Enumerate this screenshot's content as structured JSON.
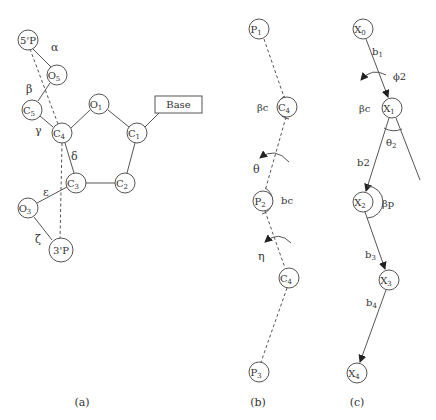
{
  "panels": {
    "a": {
      "caption": "(a)",
      "nodes": {
        "p5": "5'P",
        "o5": {
          "base": "O",
          "sub": "5"
        },
        "c5": {
          "base": "C",
          "sub": "5"
        },
        "c4": {
          "base": "C",
          "sub": "4"
        },
        "o1": {
          "base": "O",
          "sub": "1"
        },
        "c1": {
          "base": "C",
          "sub": "1"
        },
        "c2": {
          "base": "C",
          "sub": "2"
        },
        "c3": {
          "base": "C",
          "sub": "3"
        },
        "o3": {
          "base": "O",
          "sub": "3"
        },
        "p3": "3'P"
      },
      "base_box": "Base",
      "torsions": {
        "alpha": "α",
        "beta": "β",
        "gamma": "γ",
        "delta": "δ",
        "epsilon": "ε",
        "zeta": "ζ"
      }
    },
    "b": {
      "caption": "(b)",
      "nodes": [
        {
          "base": "P",
          "sub": "1"
        },
        {
          "base": "C",
          "sub": "4"
        },
        {
          "base": "P",
          "sub": "2"
        },
        {
          "base": "C",
          "sub": "4"
        },
        {
          "base": "P",
          "sub": "3"
        }
      ],
      "labels": {
        "beta_c": "βc",
        "theta": "θ",
        "bc": "bc",
        "eta": "η"
      }
    },
    "c": {
      "caption": "(c)",
      "nodes": [
        {
          "base": "X",
          "sub": "0"
        },
        {
          "base": "X",
          "sub": "1"
        },
        {
          "base": "X",
          "sub": "2"
        },
        {
          "base": "X",
          "sub": "3"
        },
        {
          "base": "X",
          "sub": "4"
        }
      ],
      "labels": {
        "b1": {
          "base": "b",
          "sub": "1"
        },
        "phi2": "ϕ2",
        "beta_c": "βc",
        "theta2": {
          "base": "θ",
          "sub": "2"
        },
        "b2": "b2",
        "beta_p": "βp",
        "b3": {
          "base": "b",
          "sub": "3"
        },
        "b4": {
          "base": "b",
          "sub": "4"
        }
      }
    }
  }
}
